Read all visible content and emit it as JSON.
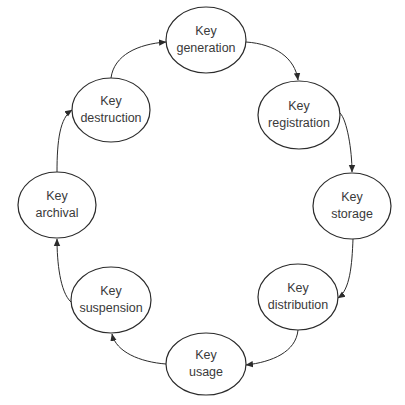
{
  "diagram": {
    "type": "cycle",
    "direction": "clockwise",
    "colors": {
      "stroke": "#2b2b2b",
      "text": "#3a3a3a",
      "background": "#ffffff"
    },
    "nodes": [
      {
        "id": "generation",
        "line1": "Key",
        "line2": "generation",
        "cx": 206,
        "cy": 40,
        "rx": 40,
        "ry": 33
      },
      {
        "id": "registration",
        "line1": "Key",
        "line2": "registration",
        "cx": 299,
        "cy": 115,
        "rx": 41,
        "ry": 34
      },
      {
        "id": "storage",
        "line1": "Key",
        "line2": "storage",
        "cx": 352,
        "cy": 206,
        "rx": 39,
        "ry": 33
      },
      {
        "id": "distribution",
        "line1": "Key",
        "line2": "distribution",
        "cx": 298,
        "cy": 297,
        "rx": 40,
        "ry": 33
      },
      {
        "id": "usage",
        "line1": "Key",
        "line2": "usage",
        "cx": 206,
        "cy": 364,
        "rx": 40,
        "ry": 31
      },
      {
        "id": "suspension",
        "line1": "Key",
        "line2": "suspension",
        "cx": 111,
        "cy": 300,
        "rx": 40,
        "ry": 33
      },
      {
        "id": "archival",
        "line1": "Key",
        "line2": "archival",
        "cx": 57,
        "cy": 205,
        "rx": 39,
        "ry": 33
      },
      {
        "id": "destruction",
        "line1": "Key",
        "line2": "destruction",
        "cx": 111,
        "cy": 110,
        "rx": 39,
        "ry": 32
      }
    ],
    "edges": [
      {
        "from": "generation",
        "to": "registration"
      },
      {
        "from": "registration",
        "to": "storage"
      },
      {
        "from": "storage",
        "to": "distribution"
      },
      {
        "from": "distribution",
        "to": "usage"
      },
      {
        "from": "usage",
        "to": "suspension"
      },
      {
        "from": "suspension",
        "to": "archival"
      },
      {
        "from": "archival",
        "to": "destruction"
      },
      {
        "from": "destruction",
        "to": "generation"
      }
    ]
  }
}
